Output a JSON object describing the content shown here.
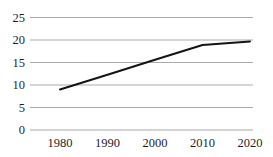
{
  "chart_data": {
    "type": "line",
    "title": "",
    "xlabel": "",
    "ylabel": "",
    "x": [
      1980,
      1990,
      2000,
      2010,
      2020
    ],
    "x_tick_labels": [
      "1980",
      "1990",
      "2000",
      "2010",
      "2020"
    ],
    "series": [
      {
        "name": "series-1",
        "values": [
          9.0,
          12.3,
          15.6,
          18.9,
          19.7
        ]
      }
    ],
    "y_ticks": [
      0,
      5,
      10,
      15,
      20,
      25
    ],
    "y_tick_labels": [
      "0",
      "5",
      "10",
      "15",
      "20",
      "25"
    ],
    "ylim": [
      0,
      25
    ],
    "grid": "horizontal",
    "legend": "none",
    "colors": {
      "line": "#141414",
      "grid": "#ababab",
      "text": "#1f1f1f",
      "background": "#ffffff"
    }
  }
}
